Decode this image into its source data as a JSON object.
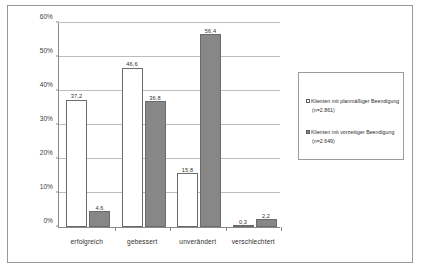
{
  "chart_data": {
    "type": "bar",
    "title": "",
    "xlabel": "",
    "ylabel": "",
    "ylim": [
      0,
      60
    ],
    "ytick_labels": [
      "0%",
      "10%",
      "20%",
      "30%",
      "40%",
      "50%",
      "60%"
    ],
    "ytick_values": [
      0,
      10,
      20,
      30,
      40,
      50,
      60
    ],
    "grid": true,
    "legend_position": "right",
    "categories": [
      "erfolgreich",
      "gebessert",
      "unverändert",
      "verschlechtert"
    ],
    "series": [
      {
        "name": "Klienten mit planmäßiger Beendigung (n=2.861)",
        "color": "#ffffff",
        "values": [
          37.2,
          46.6,
          15.8,
          0.3
        ],
        "value_labels": [
          "37,2",
          "46,6",
          "15,8",
          "0,3"
        ]
      },
      {
        "name": "Klienten mit vorzeitiger Beendigung (n=2.649)",
        "color": "#878787",
        "values": [
          4.6,
          36.8,
          56.4,
          2.2
        ],
        "value_labels": [
          "4,6",
          "36,8",
          "56,4",
          "2,2"
        ]
      }
    ]
  },
  "legend": {
    "entries": [
      {
        "label": "Klienten mit planmäßiger Beendigung",
        "sub": "(n=2.861)",
        "swatch": "light-square-swatch"
      },
      {
        "label": "Klienten mit vorzeitiger Beendigung",
        "sub": "(n=2.649)",
        "swatch": "dark-square-swatch"
      }
    ]
  }
}
